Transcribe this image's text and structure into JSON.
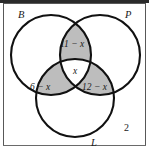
{
  "figure": {
    "kind": "venn-diagram",
    "sets_count": 3,
    "shaded_fill": "#bdbdbd",
    "unshaded_fill": "#ffffff",
    "stroke_color": "#111111",
    "frame_color": "#585858"
  },
  "set_labels": {
    "b": "B",
    "p": "P",
    "l": "L"
  },
  "region_labels": {
    "b_and_p_only": "11 − x",
    "all_three": "x",
    "b_and_l_only": "6 − x",
    "p_and_l_only": "12 − x"
  },
  "outside_labels": {
    "complement_count": "2"
  },
  "geometry": {
    "circle_b": {
      "cx": 51,
      "cy": 55,
      "r": 40
    },
    "circle_p": {
      "cx": 100,
      "cy": 55,
      "r": 40
    },
    "circle_l": {
      "cx": 75,
      "cy": 98,
      "r": 39
    }
  }
}
